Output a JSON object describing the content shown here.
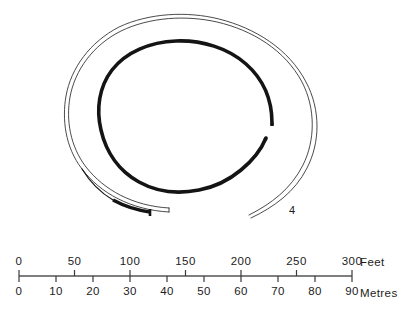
{
  "figure": {
    "number_label": "4",
    "number_label_x": 289,
    "number_label_y": 205,
    "ink_color": "#141414",
    "thin_line_color": "#2b2b2b"
  },
  "plan": {
    "outer_enclosure_name": "outer-ditch-double-line",
    "inner_enclosure_name": "inner-ditch-thick-line",
    "inner_gap_note": "entrance gap on east side",
    "outer_gap_note": "entrance gap on south side"
  },
  "scale_bar": {
    "axis_x_start": 19,
    "axis_x_end": 352,
    "axis_y": 276,
    "feet": {
      "unit_label": "Feet",
      "unit_label_x": 360,
      "unit_label_y": 257,
      "max": 300,
      "ticks": [
        {
          "value": 0,
          "label": "0",
          "x": 19,
          "major": true
        },
        {
          "value": 50,
          "label": "50",
          "x": 74.5,
          "major": true
        },
        {
          "value": 100,
          "label": "100",
          "x": 130,
          "major": true
        },
        {
          "value": 150,
          "label": "150",
          "x": 185.5,
          "major": true
        },
        {
          "value": 200,
          "label": "200",
          "x": 241,
          "major": true
        },
        {
          "value": 250,
          "label": "250",
          "x": 296.5,
          "major": true
        },
        {
          "value": 300,
          "label": "300",
          "x": 352,
          "major": true
        }
      ]
    },
    "metres": {
      "unit_label": "Metres",
      "unit_label_x": 360,
      "unit_label_y": 288,
      "max": 90,
      "ticks": [
        {
          "value": 0,
          "label": "0",
          "x": 19
        },
        {
          "value": 10,
          "label": "10",
          "x": 56
        },
        {
          "value": 20,
          "label": "20",
          "x": 93
        },
        {
          "value": 30,
          "label": "30",
          "x": 130
        },
        {
          "value": 40,
          "label": "40",
          "x": 167
        },
        {
          "value": 50,
          "label": "50",
          "x": 204
        },
        {
          "value": 60,
          "label": "60",
          "x": 241
        },
        {
          "value": 70,
          "label": "70",
          "x": 278
        },
        {
          "value": 80,
          "label": "80",
          "x": 315
        },
        {
          "value": 90,
          "label": "90",
          "x": 352
        }
      ]
    }
  }
}
